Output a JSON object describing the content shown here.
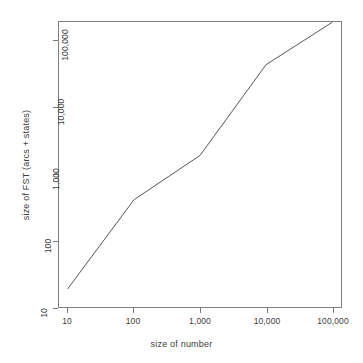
{
  "chart_data": {
    "type": "line",
    "title": "",
    "xlabel": "size of number",
    "ylabel": "size of FST (arcs + states)",
    "xscale": "log",
    "yscale": "log",
    "xlim": [
      10,
      100000
    ],
    "ylim": [
      10,
      200000
    ],
    "grid": false,
    "legend": null,
    "x": [
      10,
      100,
      1000,
      10000,
      100000
    ],
    "values": [
      13,
      280,
      1300,
      30000,
      130000
    ],
    "series": [
      {
        "name": "size of FST (arcs + states)",
        "x": [
          10,
          100,
          1000,
          10000,
          100000
        ],
        "values": [
          13,
          280,
          1300,
          30000,
          130000
        ]
      }
    ],
    "x_tick_labels": [
      "10",
      "100",
      "1,000",
      "10,000",
      "100,000"
    ],
    "y_tick_labels": [
      "10",
      "100",
      "1,000",
      "10,000",
      "100,000"
    ],
    "x_tick_values": [
      10,
      100,
      1000,
      10000,
      100000
    ],
    "y_tick_values": [
      10,
      100,
      1000,
      10000,
      100000
    ],
    "line_color": "#555555",
    "axis_color": "#808080",
    "background": "#ffffff"
  }
}
